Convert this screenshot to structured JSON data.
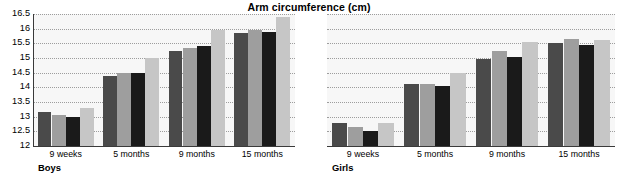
{
  "chart_data": {
    "type": "bar",
    "title": "Arm circumference (cm)",
    "xlabel": "",
    "ylabel": "",
    "ylim": [
      12,
      16.5
    ],
    "ytick_step": 0.5,
    "yticks": [
      "16.5",
      "16",
      "15.5",
      "15",
      "14.5",
      "14",
      "13.5",
      "13",
      "12.5",
      "12"
    ],
    "grid": true,
    "legend_position": "top-right",
    "categories": [
      "9 weeks",
      "5 months",
      "9 months",
      "15 months"
    ],
    "panels": [
      {
        "name": "Boys",
        "label": "Boys",
        "categories": [
          "9 weeks",
          "5 months",
          "9 months",
          "15 months"
        ],
        "series": [
          {
            "name": "Bangladeshi",
            "color": "#4a4a4a",
            "values": [
              13.15,
              14.4,
              15.25,
              15.85
            ]
          },
          {
            "name": "Pakistani",
            "color": "#9e9e9e",
            "values": [
              13.05,
              14.5,
              15.35,
              15.95
            ]
          },
          {
            "name": "Indian",
            "color": "#1a1a1a",
            "values": [
              12.98,
              14.5,
              15.4,
              15.9
            ]
          },
          {
            "name": "White",
            "color": "#c6c6c6",
            "values": [
              13.28,
              15.0,
              15.95,
              16.4
            ]
          }
        ]
      },
      {
        "name": "Girls",
        "label": "Girls",
        "categories": [
          "9 weeks",
          "5 months",
          "9 months",
          "15 months"
        ],
        "series": [
          {
            "name": "Bangladeshi",
            "color": "#4a4a4a",
            "values": [
              12.8,
              14.1,
              14.95,
              15.5
            ]
          },
          {
            "name": "Pakistani",
            "color": "#9e9e9e",
            "values": [
              12.65,
              14.12,
              15.25,
              15.65
            ]
          },
          {
            "name": "Indian",
            "color": "#1a1a1a",
            "values": [
              12.5,
              14.05,
              15.05,
              15.45
            ]
          },
          {
            "name": "White",
            "color": "#c6c6c6",
            "values": [
              12.8,
              14.5,
              15.55,
              15.62
            ]
          }
        ]
      }
    ],
    "legend": [
      {
        "label": "Bangladeshi",
        "color": "#4a4a4a"
      },
      {
        "label": "Pakistani",
        "color": "#9e9e9e"
      },
      {
        "label": "Indian",
        "color": "#1a1a1a"
      },
      {
        "label": "White",
        "color": "#c6c6c6"
      }
    ]
  }
}
